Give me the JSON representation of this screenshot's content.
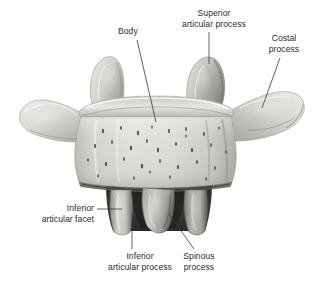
{
  "figure": {
    "background_color": "#ffffff",
    "bone_color": "#d8d6d2",
    "bone_shadow_color": "#4a4845",
    "leader_line_color": "#3a3a3a",
    "text_color": "#2c2c2c"
  },
  "labels": {
    "body": {
      "line1": "Body"
    },
    "superior_articular_process": {
      "line1": "Superior",
      "line2": "articular process"
    },
    "costal_process": {
      "line1": "Costal",
      "line2": "process"
    },
    "inferior_articular_facet": {
      "line1": "Inferior",
      "line2": "articular facet"
    },
    "inferior_articular_process": {
      "line1": "Inferior",
      "line2": "articular process"
    },
    "spinous_process": {
      "line1": "Spinous",
      "line2": "process"
    }
  },
  "parts": [
    {
      "name": "vertebral-body",
      "label": "Body"
    },
    {
      "name": "superior-articular-process-left",
      "label": "Superior articular process"
    },
    {
      "name": "superior-articular-process-right",
      "label": "Superior articular process"
    },
    {
      "name": "costal-process-left",
      "label": "Costal process"
    },
    {
      "name": "costal-process-right",
      "label": "Costal process"
    },
    {
      "name": "inferior-articular-facet",
      "label": "Inferior articular facet"
    },
    {
      "name": "inferior-articular-process-left",
      "label": "Inferior articular process"
    },
    {
      "name": "inferior-articular-process-right",
      "label": "Inferior articular process"
    },
    {
      "name": "spinous-process",
      "label": "Spinous process"
    }
  ]
}
